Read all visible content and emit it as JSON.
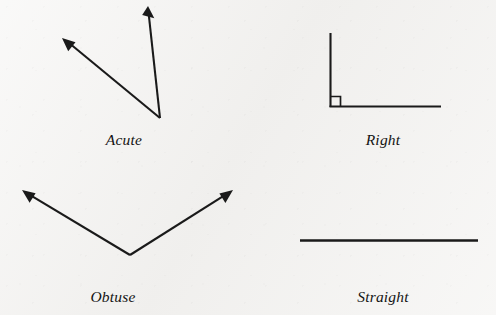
{
  "page": {
    "background_color": "#f3f2f0",
    "ink_color": "#1a1a1a",
    "width": 496,
    "height": 315
  },
  "figures": [
    {
      "id": "acute",
      "label": "Acute",
      "label_x": 124,
      "label_y": 131,
      "kind": "angle",
      "vertex": [
        160,
        118
      ],
      "rays": [
        {
          "name": "upper-left-ray",
          "to": [
            62,
            38
          ],
          "arrow": true
        },
        {
          "name": "upper-right-ray",
          "to": [
            148,
            6
          ],
          "arrow": true
        }
      ],
      "right_angle_marker": false
    },
    {
      "id": "right",
      "label": "Right",
      "label_x": 383,
      "label_y": 131,
      "kind": "angle",
      "vertex": [
        330,
        107
      ],
      "rays": [
        {
          "name": "vertical-ray",
          "to": [
            330,
            33
          ],
          "arrow": false
        },
        {
          "name": "horizontal-ray",
          "to": [
            441,
            107
          ],
          "arrow": false
        }
      ],
      "right_angle_marker": true,
      "marker_size": 10
    },
    {
      "id": "obtuse",
      "label": "Obtuse",
      "label_x": 113,
      "label_y": 288,
      "kind": "angle",
      "vertex": [
        130,
        255
      ],
      "rays": [
        {
          "name": "upper-left-ray",
          "to": [
            22,
            190
          ],
          "arrow": true
        },
        {
          "name": "upper-right-ray",
          "to": [
            233,
            190
          ],
          "arrow": true
        }
      ],
      "right_angle_marker": false
    },
    {
      "id": "straight",
      "label": "Straight",
      "label_x": 383,
      "label_y": 288,
      "kind": "line",
      "vertex": [
        389,
        240
      ],
      "rays": [
        {
          "name": "left-ray",
          "to": [
            300,
            240
          ],
          "arrow": false
        },
        {
          "name": "right-ray",
          "to": [
            478,
            240
          ],
          "arrow": false
        }
      ],
      "right_angle_marker": false
    }
  ]
}
